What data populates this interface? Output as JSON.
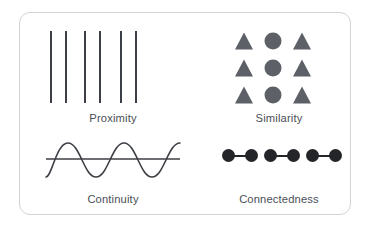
{
  "card": {
    "background_color": "#ffffff",
    "border_color": "#d3d3d3",
    "corner_radius_px": 11
  },
  "page_background_color": "#ffffff",
  "colors": {
    "line_stroke": "#3c3f45",
    "shape_gray": "#5d6066",
    "dot_black": "#232529",
    "label_text": "#4a4f57"
  },
  "quadrants": [
    {
      "id": "proximity",
      "label": "Proximity",
      "illustration": "vertical-lines",
      "description": "Six vertical lines arranged in three closely spaced pairs",
      "line_count": 6,
      "line_x_positions": [
        10,
        25,
        44,
        59,
        80,
        95
      ],
      "line_height": 72,
      "line_width": 1.5
    },
    {
      "id": "similarity",
      "label": "Similarity",
      "illustration": "shape-grid",
      "description": "Three by three grid with triangle, circle, triangle in each row",
      "rows": 3,
      "columns": 3,
      "grid": [
        [
          "triangle",
          "circle",
          "triangle"
        ],
        [
          "triangle",
          "circle",
          "triangle"
        ],
        [
          "triangle",
          "circle",
          "triangle"
        ]
      ],
      "column_x_positions": [
        38,
        67,
        96
      ],
      "row_y_positions": [
        11,
        38,
        65
      ]
    },
    {
      "id": "continuity",
      "label": "Continuity",
      "illustration": "sine-wave-crossing-line",
      "description": "A continuous sine wave crossing a straight horizontal line",
      "wave_cycles": 3,
      "wave_amplitude": 16,
      "baseline_y": 24
    },
    {
      "id": "connectedness",
      "label": "Connectedness",
      "illustration": "connected-dots",
      "description": "Six filled dots joined by short bars into three connected pairs",
      "dot_count": 6,
      "pair_count": 3,
      "pairs": [
        {
          "start_x": 16,
          "end_x": 46
        },
        {
          "start_x": 58,
          "end_x": 88
        },
        {
          "start_x": 100,
          "end_x": 130
        }
      ],
      "dot_diameter": 13
    }
  ]
}
